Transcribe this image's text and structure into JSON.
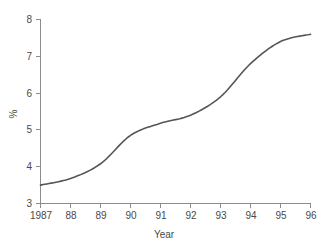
{
  "chart_data": {
    "type": "line",
    "title": "",
    "xlabel": "Year",
    "ylabel": "%",
    "categories": [
      "1987",
      "88",
      "89",
      "90",
      "91",
      "92",
      "93",
      "94",
      "95",
      "96"
    ],
    "x": [
      1987,
      1988,
      1989,
      1990,
      1991,
      1992,
      1993,
      1994,
      1995,
      1996
    ],
    "values": [
      3.5,
      3.68,
      4.08,
      4.85,
      5.18,
      5.4,
      5.9,
      6.8,
      7.4,
      7.6
    ],
    "series": [
      {
        "name": "%",
        "values": [
          3.5,
          3.68,
          4.08,
          4.85,
          5.18,
          5.4,
          5.9,
          6.8,
          7.4,
          7.6
        ],
        "color": "#555555"
      }
    ],
    "xlim": [
      1987,
      1996
    ],
    "ylim": [
      3,
      8
    ],
    "yticks": [
      3,
      4,
      5,
      6,
      7,
      8
    ],
    "yticklabels": [
      "3",
      "4",
      "5",
      "6",
      "7",
      "8"
    ],
    "xticks": [
      1987,
      1988,
      1989,
      1990,
      1991,
      1992,
      1993,
      1994,
      1995,
      1996
    ],
    "xticklabels": [
      "1987",
      "88",
      "89",
      "90",
      "91",
      "92",
      "93",
      "94",
      "95",
      "96"
    ],
    "grid": false,
    "legend": false,
    "legend_position": "none",
    "line_color": "#555555",
    "axis_color": "#8c8c8c",
    "background_color": "#ffffff"
  },
  "axes": {
    "y_title": "%",
    "x_title": "Year"
  }
}
